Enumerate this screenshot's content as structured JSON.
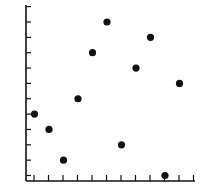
{
  "chart_data": {
    "type": "scatter",
    "title": "",
    "xlabel": "",
    "ylabel": "",
    "x": [
      1,
      2,
      3,
      4,
      5,
      6,
      7,
      8,
      9,
      10,
      11
    ],
    "y": [
      5,
      4,
      2,
      6,
      9,
      11,
      3,
      8,
      10,
      1,
      7
    ],
    "xlim": [
      0,
      12
    ],
    "ylim": [
      0,
      12
    ],
    "x_ticks": 12,
    "y_ticks": 12,
    "tick_labels": false,
    "grid": false,
    "legend": null,
    "marker_color": "#111111",
    "axis_color": "#111111"
  }
}
